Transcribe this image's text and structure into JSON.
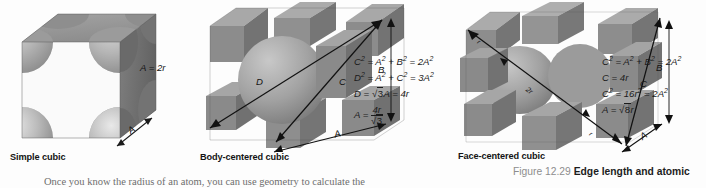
{
  "figure": {
    "caption_number": "Figure 12.29",
    "caption_text": "Edge length and atomic",
    "body_text_fragment": "Once you know the radius of an atom, you can use geometry to calculate the"
  },
  "panels": [
    {
      "id": "simple-cubic",
      "label": "Simple cubic",
      "dimension_labels": [
        {
          "name": "edge-label-A2r",
          "text": "A = 2r"
        },
        {
          "name": "edge-label-A",
          "text": "A"
        }
      ],
      "equations": []
    },
    {
      "id": "body-centered-cubic",
      "label": "Body-centered cubic",
      "dimension_labels": [
        {
          "name": "diagonal-label-D",
          "text": "D"
        },
        {
          "name": "diagonal-label-C",
          "text": "C"
        },
        {
          "name": "height-label-B",
          "text": "B"
        },
        {
          "name": "edge-label-A",
          "text": "A"
        }
      ],
      "equations": [
        "C2 = A2 + B2 = 2A2",
        "D2 = A2 + C2 = 3A2",
        "D = sqrt3 A = 4r",
        "A = 4r / sqrt3"
      ]
    },
    {
      "id": "face-centered-cubic",
      "label": "Face-centered cubic",
      "dimension_labels": [
        {
          "name": "diagonal-label-r-top",
          "text": "r"
        },
        {
          "name": "diagonal-label-2r",
          "text": "2r"
        },
        {
          "name": "diagonal-label-r-bottom",
          "text": "r"
        },
        {
          "name": "diagonal-label-C",
          "text": "C"
        },
        {
          "name": "height-label-B",
          "text": "B"
        },
        {
          "name": "edge-label-A",
          "text": "A"
        }
      ],
      "equations": [
        "C2 = A2 + B2 = 2A2",
        "C = 4r",
        "C2 = 16r2 = 2A2",
        "A = sqrt8 r"
      ]
    }
  ],
  "colors": {
    "background": "#fdfdfd",
    "cube_top_face": "#9a9a9a",
    "cube_left_face": "#848484",
    "cube_right_face": "#6f6f6f",
    "sphere_light": "#b4b4b4",
    "sphere_dark": "#787878",
    "arrow": "#1a1a1a",
    "caption_number": "#8d8d8d",
    "caption_text": "#1c1c1c"
  }
}
